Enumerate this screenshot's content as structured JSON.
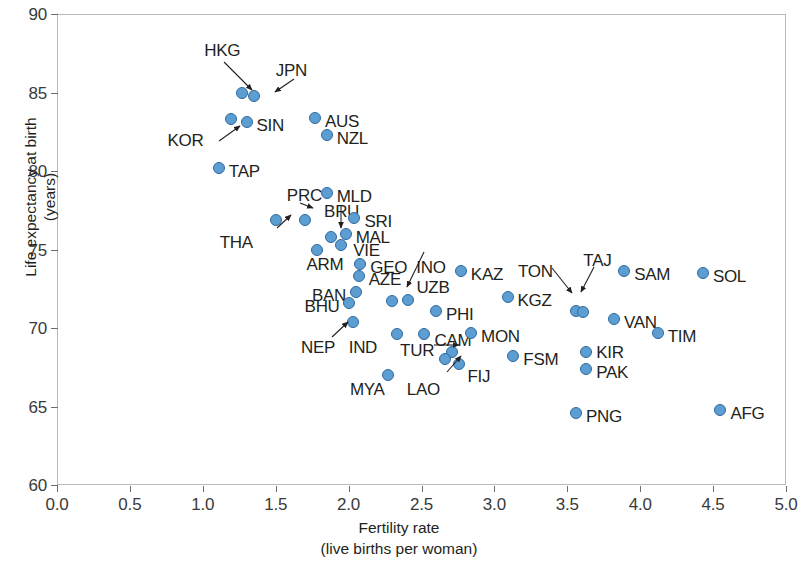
{
  "chart_data": {
    "type": "scatter",
    "title": "",
    "xlabel": "Fertility rate",
    "xlabel_sub": "(live births per woman)",
    "ylabel": "Life expectancy at birth",
    "ylabel_sub": "(years)",
    "xlim": [
      0.0,
      5.0
    ],
    "ylim": [
      60,
      90
    ],
    "xticks": [
      "0.0",
      "0.5",
      "1.0",
      "1.5",
      "2.0",
      "2.5",
      "3.0",
      "3.5",
      "4.0",
      "4.5",
      "5.0"
    ],
    "xtick_values": [
      0.0,
      0.5,
      1.0,
      1.5,
      2.0,
      2.5,
      3.0,
      3.5,
      4.0,
      4.5,
      5.0
    ],
    "yticks": [
      "60",
      "65",
      "70",
      "75",
      "80",
      "85",
      "90"
    ],
    "ytick_values": [
      60,
      65,
      70,
      75,
      80,
      85,
      90
    ],
    "grid": false,
    "legend": null,
    "marker_color": "#5d9ed2",
    "marker_edge_color": "#2f6a9e",
    "frame_color": "#b9b9b9",
    "points": [
      {
        "code": "HKG",
        "x": 1.27,
        "y": 85.0,
        "label_dx": -38,
        "label_dy": -43,
        "arrow": true
      },
      {
        "code": "JPN",
        "x": 1.35,
        "y": 84.8,
        "label_dx": 22,
        "label_dy": -26,
        "arrow": true
      },
      {
        "code": "KOR",
        "x": 1.19,
        "y": 83.3,
        "label_dx": -63,
        "label_dy": 21,
        "arrow": true
      },
      {
        "code": "SIN",
        "x": 1.3,
        "y": 83.1,
        "label_dx": 10,
        "label_dy": 3,
        "arrow": false
      },
      {
        "code": "TAP",
        "x": 1.11,
        "y": 80.2,
        "label_dx": 10,
        "label_dy": 3,
        "arrow": false
      },
      {
        "code": "AUS",
        "x": 1.77,
        "y": 83.4,
        "label_dx": 10,
        "label_dy": 3,
        "arrow": false
      },
      {
        "code": "NZL",
        "x": 1.85,
        "y": 82.3,
        "label_dx": 10,
        "label_dy": 3,
        "arrow": false
      },
      {
        "code": "PRC",
        "x": 1.7,
        "y": 76.9,
        "label_dx": -18,
        "label_dy": -25,
        "arrow": true
      },
      {
        "code": "THA",
        "x": 1.5,
        "y": 76.9,
        "label_dx": -56,
        "label_dy": 22,
        "arrow": true
      },
      {
        "code": "MLD",
        "x": 1.85,
        "y": 78.6,
        "label_dx": 10,
        "label_dy": 3,
        "arrow": false
      },
      {
        "code": "BRU",
        "x": 1.88,
        "y": 75.8,
        "label_dx": -7,
        "label_dy": -26,
        "arrow": true
      },
      {
        "code": "SRI",
        "x": 2.04,
        "y": 77.0,
        "label_dx": 10,
        "label_dy": 3,
        "arrow": false
      },
      {
        "code": "MAL",
        "x": 1.98,
        "y": 76.0,
        "label_dx": 10,
        "label_dy": 3,
        "arrow": false
      },
      {
        "code": "VIE",
        "x": 1.95,
        "y": 75.3,
        "label_dx": 12,
        "label_dy": 5,
        "arrow": false
      },
      {
        "code": "ARM",
        "x": 1.78,
        "y": 75.0,
        "label_dx": -10,
        "label_dy": 14,
        "arrow": false
      },
      {
        "code": "GEO",
        "x": 2.08,
        "y": 74.1,
        "label_dx": 10,
        "label_dy": 3,
        "arrow": false
      },
      {
        "code": "AZE",
        "x": 2.07,
        "y": 73.3,
        "label_dx": 10,
        "label_dy": 3,
        "arrow": false
      },
      {
        "code": "BAN",
        "x": 2.05,
        "y": 72.3,
        "label_dx": -44,
        "label_dy": 3,
        "arrow": false
      },
      {
        "code": "BHU",
        "x": 2.0,
        "y": 71.6,
        "label_dx": -44,
        "label_dy": 3,
        "arrow": false
      },
      {
        "code": "INO",
        "x": 2.3,
        "y": 71.7,
        "label_dx": 24,
        "label_dy": -34,
        "arrow": true
      },
      {
        "code": "UZB",
        "x": 2.41,
        "y": 71.8,
        "label_dx": 8,
        "label_dy": -13,
        "arrow": false
      },
      {
        "code": "PHI",
        "x": 2.6,
        "y": 71.1,
        "label_dx": 10,
        "label_dy": 3,
        "arrow": false
      },
      {
        "code": "KAZ",
        "x": 2.77,
        "y": 73.6,
        "label_dx": 10,
        "label_dy": 3,
        "arrow": false
      },
      {
        "code": "KGZ",
        "x": 3.09,
        "y": 72.0,
        "label_dx": 10,
        "label_dy": 3,
        "arrow": false
      },
      {
        "code": "NEP",
        "x": 2.03,
        "y": 70.4,
        "label_dx": -52,
        "label_dy": 25,
        "arrow": true
      },
      {
        "code": "IND",
        "x": 2.33,
        "y": 69.6,
        "label_dx": -48,
        "label_dy": 13,
        "arrow": false
      },
      {
        "code": "CAM",
        "x": 2.52,
        "y": 69.6,
        "label_dx": 10,
        "label_dy": 6,
        "arrow": false
      },
      {
        "code": "MON",
        "x": 2.84,
        "y": 69.7,
        "label_dx": 10,
        "label_dy": 3,
        "arrow": false
      },
      {
        "code": "TUR",
        "x": 2.71,
        "y": 68.5,
        "label_dx": -52,
        "label_dy": -2,
        "arrow": true
      },
      {
        "code": "LAO",
        "x": 2.66,
        "y": 68.0,
        "label_dx": -38,
        "label_dy": 30,
        "arrow": true
      },
      {
        "code": "FIJ",
        "x": 2.76,
        "y": 67.7,
        "label_dx": 8,
        "label_dy": 12,
        "arrow": false
      },
      {
        "code": "FSM",
        "x": 3.13,
        "y": 68.2,
        "label_dx": 10,
        "label_dy": 3,
        "arrow": false
      },
      {
        "code": "MYA",
        "x": 2.27,
        "y": 67.0,
        "label_dx": -38,
        "label_dy": 14,
        "arrow": false
      },
      {
        "code": "TON",
        "x": 3.56,
        "y": 71.1,
        "label_dx": -58,
        "label_dy": -40,
        "arrow": true
      },
      {
        "code": "TAJ",
        "x": 3.61,
        "y": 71.0,
        "label_dx": 0,
        "label_dy": -52,
        "arrow": true
      },
      {
        "code": "SAM",
        "x": 3.89,
        "y": 73.6,
        "label_dx": 10,
        "label_dy": 3,
        "arrow": false
      },
      {
        "code": "SOL",
        "x": 4.43,
        "y": 73.5,
        "label_dx": 10,
        "label_dy": 3,
        "arrow": false
      },
      {
        "code": "VAN",
        "x": 3.82,
        "y": 70.6,
        "label_dx": 10,
        "label_dy": 3,
        "arrow": false
      },
      {
        "code": "TIM",
        "x": 4.12,
        "y": 69.7,
        "label_dx": 10,
        "label_dy": 3,
        "arrow": false
      },
      {
        "code": "KIR",
        "x": 3.63,
        "y": 68.5,
        "label_dx": 10,
        "label_dy": 0,
        "arrow": false
      },
      {
        "code": "PAK",
        "x": 3.63,
        "y": 67.4,
        "label_dx": 10,
        "label_dy": 3,
        "arrow": false
      },
      {
        "code": "PNG",
        "x": 3.56,
        "y": 64.6,
        "label_dx": 10,
        "label_dy": 3,
        "arrow": false
      },
      {
        "code": "AFG",
        "x": 4.55,
        "y": 64.8,
        "label_dx": 10,
        "label_dy": 3,
        "arrow": false
      }
    ],
    "annotations": [
      {
        "for": "HKG",
        "from_x": 224,
        "from_y": 62,
        "to_x": 252,
        "to_y": 90
      },
      {
        "for": "JPN",
        "from_x": 294,
        "from_y": 79,
        "to_x": 275,
        "to_y": 92
      },
      {
        "for": "KOR",
        "from_x": 219,
        "from_y": 141,
        "to_x": 240,
        "to_y": 126
      },
      {
        "for": "PRC",
        "from_x": 300,
        "from_y": 203,
        "to_x": 313,
        "to_y": 208
      },
      {
        "for": "THA",
        "from_x": 277,
        "from_y": 228,
        "to_x": 291,
        "to_y": 215
      },
      {
        "for": "BRU",
        "from_x": 341,
        "from_y": 205,
        "to_x": 341,
        "to_y": 228
      },
      {
        "for": "INO",
        "from_x": 424,
        "from_y": 252,
        "to_x": 407,
        "to_y": 287
      },
      {
        "for": "NEP",
        "from_x": 332,
        "from_y": 337,
        "to_x": 348,
        "to_y": 322
      },
      {
        "for": "TUR",
        "from_x": 434,
        "from_y": 345,
        "to_x": 459,
        "to_y": 345
      },
      {
        "for": "LAO",
        "from_x": 447,
        "from_y": 372,
        "to_x": 461,
        "to_y": 356
      },
      {
        "for": "TON",
        "from_x": 552,
        "from_y": 268,
        "to_x": 572,
        "to_y": 293
      },
      {
        "for": "TAJ",
        "from_x": 594,
        "from_y": 267,
        "to_x": 581,
        "to_y": 292
      }
    ]
  }
}
